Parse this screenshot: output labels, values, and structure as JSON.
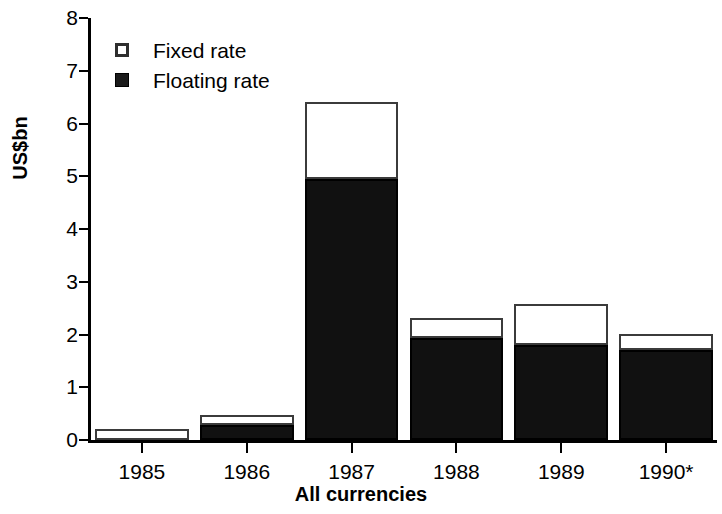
{
  "chart_data": {
    "type": "bar",
    "stacked": true,
    "title": "",
    "xlabel": "All currencies",
    "ylabel": "US$bn",
    "categories": [
      "1985",
      "1986",
      "1987",
      "1988",
      "1989",
      "1990*"
    ],
    "series": [
      {
        "name": "Floating rate",
        "color": "#111111",
        "values": [
          0.0,
          0.28,
          4.95,
          1.93,
          1.8,
          1.71
        ]
      },
      {
        "name": "Fixed rate",
        "color": "#ffffff",
        "values": [
          0.21,
          0.19,
          1.45,
          0.38,
          0.78,
          0.3
        ]
      }
    ],
    "totals": [
      0.21,
      0.47,
      6.4,
      2.31,
      2.58,
      2.01
    ],
    "ylim": [
      0,
      8
    ],
    "yticks": [
      0,
      1,
      2,
      3,
      4,
      5,
      6,
      7,
      8
    ],
    "ytick_labels": [
      "0",
      "1",
      "2",
      "3",
      "4",
      "5",
      "6",
      "7",
      "8"
    ],
    "grid": false,
    "legend_position": "top-left",
    "legend_entries": [
      {
        "label": "Fixed rate",
        "swatch": "open-square"
      },
      {
        "label": "Floating rate",
        "swatch": "filled-square"
      }
    ]
  },
  "axis": {
    "y_label": "US$bn",
    "x_label": "All currencies"
  },
  "legend": {
    "fixed_label": "Fixed rate",
    "floating_label": "Floating rate"
  },
  "ticks": {
    "y": [
      "8",
      "7",
      "6",
      "5",
      "4",
      "3",
      "2",
      "1",
      "0"
    ],
    "x": [
      "1985",
      "1986",
      "1987",
      "1988",
      "1989",
      "1990*"
    ]
  },
  "colors": {
    "floating": "#111111",
    "fixed": "#ffffff",
    "axis": "#000000"
  }
}
